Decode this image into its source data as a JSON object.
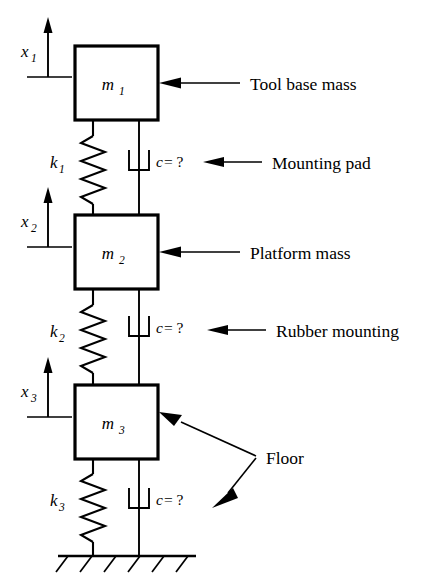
{
  "figure": {
    "background_color": "#ffffff",
    "line_color": "#000000"
  },
  "masses": [
    {
      "id": "m1",
      "label": "m",
      "subscript": "1",
      "annotation": "Tool base mass"
    },
    {
      "id": "m2",
      "label": "m",
      "subscript": "2",
      "annotation": "Platform mass"
    },
    {
      "id": "m3",
      "label": "m",
      "subscript": "3",
      "annotation": "Floor"
    }
  ],
  "springs": [
    {
      "id": "k1",
      "label": "k",
      "subscript": "1"
    },
    {
      "id": "k2",
      "label": "k",
      "subscript": "2"
    },
    {
      "id": "k3",
      "label": "k",
      "subscript": "3"
    }
  ],
  "dampers": [
    {
      "id": "c1",
      "symbol": "c",
      "equals": " = ?",
      "annotation": "Mounting pad"
    },
    {
      "id": "c2",
      "symbol": "c",
      "equals": " = ?",
      "annotation": "Rubber mounting"
    },
    {
      "id": "c3",
      "symbol": "c",
      "equals": " = ?",
      "annotation": "Floor"
    }
  ],
  "coordinates": [
    {
      "id": "x1",
      "label": "x",
      "subscript": "1"
    },
    {
      "id": "x2",
      "label": "x",
      "subscript": "2"
    },
    {
      "id": "x3",
      "label": "x",
      "subscript": "3"
    }
  ],
  "annotations": {
    "tool_base_mass": "Tool base mass",
    "mounting_pad": "Mounting pad",
    "platform_mass": "Platform mass",
    "rubber_mounting": "Rubber mounting",
    "floor": "Floor"
  },
  "ground": {
    "name": "fixed-ground",
    "hatch_count": 6
  }
}
